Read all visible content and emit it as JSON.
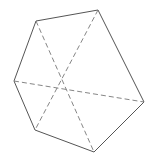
{
  "diagram": {
    "type": "hexagon-with-diagonals",
    "stroke_color": "#555555",
    "dash_color": "#777777",
    "vertices": [
      {
        "name": "top-left",
        "x": 36,
        "y": 21
      },
      {
        "name": "top-right",
        "x": 98,
        "y": 10
      },
      {
        "name": "right",
        "x": 144,
        "y": 102
      },
      {
        "name": "bottom",
        "x": 94,
        "y": 152
      },
      {
        "name": "bottom-left",
        "x": 35,
        "y": 130
      },
      {
        "name": "left",
        "x": 14,
        "y": 81
      }
    ],
    "center": {
      "x": 62,
      "y": 85
    },
    "diagonals": [
      {
        "from": "top-left",
        "to": "bottom"
      },
      {
        "from": "top-right",
        "to": "bottom-left"
      },
      {
        "from": "left",
        "to": "right"
      }
    ]
  }
}
